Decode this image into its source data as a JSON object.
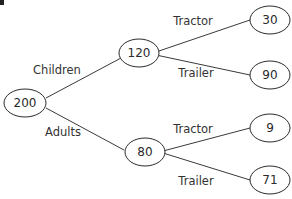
{
  "diagram": {
    "type": "probability-tree",
    "root": {
      "id": "root",
      "value": "200"
    },
    "level1": [
      {
        "id": "children",
        "value": "120",
        "edge_label": "Children"
      },
      {
        "id": "adults",
        "value": "80",
        "edge_label": "Adults"
      }
    ],
    "level2": [
      {
        "id": "children-tractor",
        "parent": "children",
        "value": "30",
        "edge_label": "Tractor"
      },
      {
        "id": "children-trailer",
        "parent": "children",
        "value": "90",
        "edge_label": "Trailer"
      },
      {
        "id": "adults-tractor",
        "parent": "adults",
        "value": "9",
        "edge_label": "Tractor"
      },
      {
        "id": "adults-trailer",
        "parent": "adults",
        "value": "71",
        "edge_label": "Trailer"
      }
    ]
  }
}
